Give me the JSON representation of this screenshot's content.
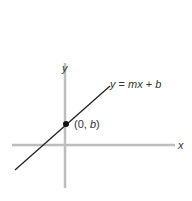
{
  "diagram": {
    "axis_x_label": "x",
    "axis_y_label": "y",
    "line_label_y": "y",
    "line_label_eq": " = ",
    "line_label_mx": "mx",
    "line_label_plus": " + ",
    "line_label_b": "b",
    "point_label_open": "(0, ",
    "point_label_b": "b",
    "point_label_close": ")",
    "colors": {
      "axes": "#bdbdbd",
      "line": "#222222",
      "text": "#333333"
    }
  }
}
